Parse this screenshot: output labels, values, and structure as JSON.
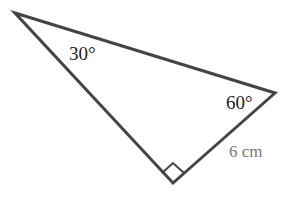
{
  "diagram": {
    "type": "right-triangle",
    "colors": {
      "stroke": "#444444",
      "angle_label": "#222222",
      "side_label": "#777777",
      "background": "#ffffff"
    },
    "vertices": {
      "top_left": {
        "x": 15,
        "y": 13
      },
      "right": {
        "x": 275,
        "y": 93
      },
      "bottom": {
        "x": 173,
        "y": 183
      }
    },
    "labels": {
      "angle_top_left": "30°",
      "angle_right": "60°",
      "side_right_bottom": "6 cm"
    },
    "right_angle_marker": "right-angle-at-bottom"
  }
}
